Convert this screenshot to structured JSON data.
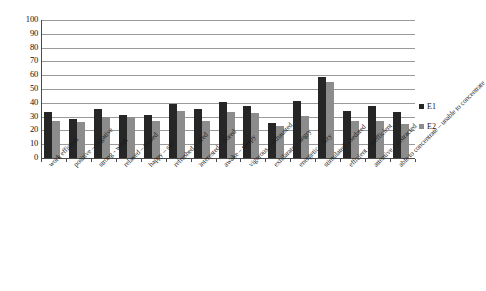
{
  "chart_data": {
    "type": "bar",
    "title": "",
    "xlabel": "",
    "ylabel": "",
    "ylim": [
      0,
      100
    ],
    "ytick_step": 10,
    "yticks": [
      "100",
      "90",
      "80",
      "70",
      "60",
      "50",
      "40",
      "30",
      "20",
      "10",
      "0"
    ],
    "grid": true,
    "legend_position": "right",
    "categories": [
      "work efficient",
      "positive – negative",
      "strong - weak",
      "relaxed – tensed",
      "happy – sad",
      "refreshed – tired",
      "interested – bored",
      "awake – sleepy",
      "vigorous – exhausted",
      "exhilarate – angry",
      "energetic – lazy",
      "stimulated – sedated",
      "efficient – inefficient",
      "attentive – distracted",
      "able to concentrate – unable to concentrate"
    ],
    "series": [
      {
        "name": "E1",
        "color": "#262626",
        "values": [
          33.5,
          28.5,
          35.5,
          31.5,
          31,
          39.5,
          35.5,
          40.5,
          37.5,
          25.5,
          41,
          58.5,
          34,
          38,
          33
        ]
      },
      {
        "name": "E2",
        "color": "#8c8c8c",
        "values": [
          26.5,
          26,
          29.5,
          30,
          27,
          34,
          27,
          33.5,
          32.5,
          23.5,
          30.5,
          55,
          26.5,
          27,
          24.5
        ]
      }
    ]
  },
  "legend": {
    "items": [
      {
        "label": "E1",
        "swatch": "e1"
      },
      {
        "label": "E2",
        "swatch": "e2"
      }
    ]
  }
}
